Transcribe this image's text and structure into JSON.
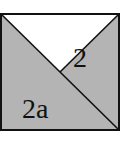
{
  "diagram": {
    "labels": {
      "upper_right_region": "2",
      "lower_left_region": "2a"
    },
    "colors": {
      "shaded": "#b4b4b4",
      "white": "#ffffff",
      "stroke": "#111111"
    }
  }
}
